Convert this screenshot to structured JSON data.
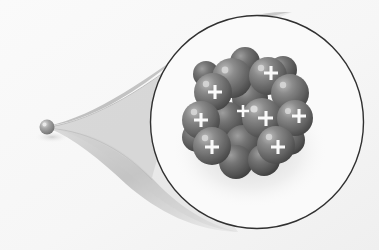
{
  "figure": {
    "title": "Atomic nucleus magnification diagram",
    "background_color": "#fdfdfd"
  },
  "atom": {
    "label": "atom",
    "center_x": 47,
    "center_y": 127,
    "radius": 7.5,
    "color": "#8d8d8d",
    "highlight_color": "#e8e8e8"
  },
  "funnel": {
    "label": "magnifier-cone",
    "fill_color": "#cfcfcf",
    "edge_color": "#b4b4b4"
  },
  "magnifier": {
    "label": "magnified-view-circle",
    "center_x": 257,
    "center_y": 122,
    "radius": 107,
    "stroke_color": "#2b2b2b",
    "stroke_width": 1.4,
    "fill_color": "#ffffff"
  },
  "nucleus": {
    "label": "atomic-nucleus",
    "center_x": 248,
    "center_y": 112,
    "particle_radius": 18,
    "proton_label": "proton",
    "neutron_label": "neutron",
    "charge_symbol": "+",
    "charge_symbol_color": "#ffffff",
    "proton_color": "#6f6f6f",
    "neutron_color": "#7d7d7d",
    "particle_dark": "#3f3f3f",
    "particle_highlight": "#b9b9b9",
    "proton_count": 8,
    "particle_count": 19,
    "particles": [
      {
        "id": 1,
        "x": 232,
        "y": 78,
        "r": 20,
        "charge": false,
        "depth": 0
      },
      {
        "id": 2,
        "x": 268,
        "y": 76,
        "r": 19,
        "charge": true,
        "depth": 0
      },
      {
        "id": 3,
        "x": 213,
        "y": 92,
        "r": 19,
        "charge": true,
        "depth": 0
      },
      {
        "id": 4,
        "x": 290,
        "y": 93,
        "r": 19,
        "charge": false,
        "depth": 0
      },
      {
        "id": 5,
        "x": 250,
        "y": 98,
        "r": 18,
        "charge": false,
        "depth": 1
      },
      {
        "id": 6,
        "x": 201,
        "y": 120,
        "r": 19,
        "charge": true,
        "depth": 0
      },
      {
        "id": 7,
        "x": 228,
        "y": 120,
        "r": 18,
        "charge": false,
        "depth": 1
      },
      {
        "id": 8,
        "x": 262,
        "y": 118,
        "r": 20,
        "charge": true,
        "depth": 0
      },
      {
        "id": 9,
        "x": 295,
        "y": 118,
        "r": 18,
        "charge": true,
        "depth": 0
      },
      {
        "id": 10,
        "x": 212,
        "y": 146,
        "r": 19,
        "charge": true,
        "depth": 0
      },
      {
        "id": 11,
        "x": 243,
        "y": 143,
        "r": 18,
        "charge": false,
        "depth": 1
      },
      {
        "id": 12,
        "x": 276,
        "y": 145,
        "r": 19,
        "charge": true,
        "depth": 0
      },
      {
        "id": 13,
        "x": 236,
        "y": 162,
        "r": 17,
        "charge": false,
        "depth": 0
      },
      {
        "id": 14,
        "x": 264,
        "y": 160,
        "r": 16,
        "charge": false,
        "depth": 0
      },
      {
        "id": 15,
        "x": 290,
        "y": 140,
        "r": 15,
        "charge": false,
        "depth": 1
      },
      {
        "id": 16,
        "x": 197,
        "y": 137,
        "r": 15,
        "charge": false,
        "depth": 1
      },
      {
        "id": 17,
        "x": 245,
        "y": 62,
        "r": 15,
        "charge": false,
        "depth": 1
      },
      {
        "id": 18,
        "x": 283,
        "y": 70,
        "r": 14,
        "charge": false,
        "depth": 1
      },
      {
        "id": 19,
        "x": 206,
        "y": 74,
        "r": 13,
        "charge": false,
        "depth": 1
      }
    ]
  }
}
